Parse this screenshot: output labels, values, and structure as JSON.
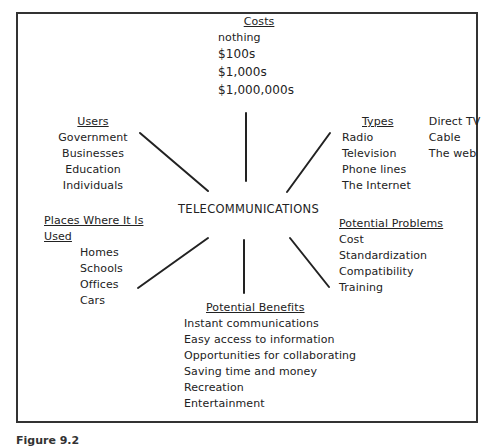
{
  "diagram": {
    "hub": "TELECOMMUNICATIONS",
    "branches": {
      "costs": {
        "title": "Costs",
        "items": [
          "nothing",
          "$100s",
          "$1,000s",
          "$1,000,000s"
        ]
      },
      "users": {
        "title": "Users",
        "items": [
          "Government",
          "Businesses",
          "Education",
          "Individuals"
        ]
      },
      "types": {
        "title": "Types",
        "items_col1": [
          "Radio",
          "Television",
          "Phone lines",
          "The Internet"
        ],
        "items_col2": [
          "Direct TV",
          "Cable",
          "The web"
        ]
      },
      "places": {
        "title": "Places Where It Is Used",
        "items": [
          "Homes",
          "Schools",
          "Offices",
          "Cars"
        ]
      },
      "problems": {
        "title": "Potential Problems",
        "items": [
          "Cost",
          "Standardization",
          "Compatibility",
          "Training"
        ]
      },
      "benefits": {
        "title": "Potential Benefits",
        "items": [
          "Instant communications",
          "Easy access to information",
          "Opportunities for collaborating",
          "Saving time and money",
          "Recreation",
          "Entertainment"
        ]
      }
    },
    "caption": "Figure 9.2",
    "colors": {
      "line": "#222222",
      "frame": "#333333",
      "background": "#ffffff"
    }
  }
}
